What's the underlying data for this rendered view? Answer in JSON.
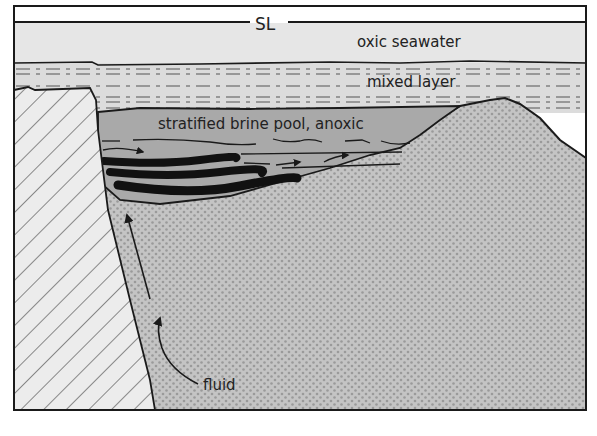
{
  "diagram": {
    "labels": {
      "sea_level": "SL",
      "oxic_seawater": "oxic seawater",
      "mixed_layer": "mixed layer",
      "brine_pool": "stratified brine pool, anoxic",
      "fluid": "fluid"
    },
    "colors": {
      "frame": "#1a1a1a",
      "air": "#ffffff",
      "oxic_seawater": "#e6e6e6",
      "mixed_layer": "#dcdcdc",
      "brine_pool": "#a9a9a9",
      "sediment": "#c4c4c4",
      "sediment_dots": "#9a9a9a",
      "bedrock_fill": "#ececec",
      "bedrock_hatch": "#444444",
      "deposits": "#111111"
    }
  }
}
